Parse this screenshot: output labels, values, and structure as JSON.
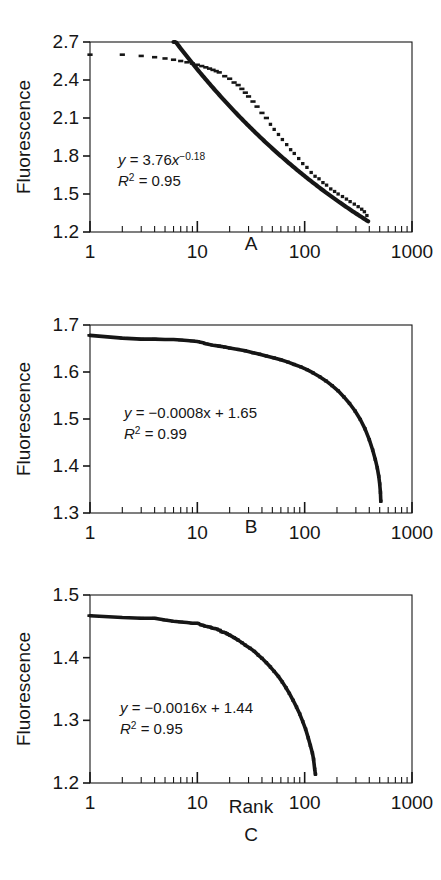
{
  "figure": {
    "y_axis_label": "Fluorescence",
    "x_axis_label": "Rank",
    "ink_color": "#161616"
  },
  "chart_data": [
    {
      "id": "A",
      "type": "scatter",
      "panel_label": "A",
      "title": "",
      "xlabel": "",
      "ylabel": "Fluorescence",
      "xscale": "log",
      "xlim": [
        1,
        1000
      ],
      "xticks": [
        1,
        10,
        100,
        1000
      ],
      "xtick_labels": [
        "1",
        "10",
        "100",
        "1000"
      ],
      "ylim": [
        1.2,
        2.7
      ],
      "yticks": [
        1.2,
        1.5,
        1.8,
        2.1,
        2.4,
        2.7
      ],
      "ytick_labels": [
        "1.2",
        "1.5",
        "1.8",
        "2.1",
        "2.4",
        "2.7"
      ],
      "grid": false,
      "legend": "none",
      "annotations": [
        "y = 3.76x^-0.18",
        "R^2 = 0.95"
      ],
      "equation_text": "y = 3.76x",
      "equation_exponent": "−0.18",
      "r2_text": " = 0.95",
      "fit": {
        "kind": "power",
        "a": 3.76,
        "b": -0.18,
        "r2": 0.95,
        "x_start": 6,
        "x_end": 390
      },
      "data_x": [
        1,
        2,
        3,
        4,
        5,
        6,
        7,
        8,
        9,
        10,
        11,
        12,
        13,
        14,
        15,
        16,
        18,
        20,
        22,
        24,
        26,
        28,
        30,
        33,
        36,
        40,
        44,
        48,
        52,
        57,
        62,
        68,
        74,
        80,
        88,
        96,
        105,
        115,
        125,
        136,
        148,
        160,
        175,
        190,
        205,
        225,
        245,
        265,
        290,
        315,
        340,
        360,
        380
      ],
      "data_y": [
        2.6,
        2.6,
        2.59,
        2.58,
        2.57,
        2.56,
        2.55,
        2.54,
        2.53,
        2.52,
        2.51,
        2.5,
        2.49,
        2.48,
        2.47,
        2.46,
        2.43,
        2.41,
        2.38,
        2.36,
        2.33,
        2.3,
        2.27,
        2.23,
        2.19,
        2.14,
        2.1,
        2.05,
        2.01,
        1.97,
        1.93,
        1.89,
        1.85,
        1.82,
        1.78,
        1.74,
        1.71,
        1.67,
        1.64,
        1.62,
        1.59,
        1.57,
        1.54,
        1.52,
        1.5,
        1.48,
        1.46,
        1.44,
        1.42,
        1.4,
        1.38,
        1.36,
        1.33
      ]
    },
    {
      "id": "B",
      "type": "scatter",
      "panel_label": "B",
      "title": "",
      "xlabel": "",
      "ylabel": "Fluorescence",
      "xscale": "log",
      "xlim": [
        1,
        1000
      ],
      "xticks": [
        1,
        10,
        100,
        1000
      ],
      "xtick_labels": [
        "1",
        "10",
        "100",
        "1000"
      ],
      "ylim": [
        1.3,
        1.7
      ],
      "yticks": [
        1.3,
        1.4,
        1.5,
        1.6,
        1.7
      ],
      "ytick_labels": [
        "1.3",
        "1.4",
        "1.5",
        "1.6",
        "1.7"
      ],
      "grid": false,
      "legend": "none",
      "annotations": [
        "y = −0.0008x + 1.65",
        "R^2 = 0.99"
      ],
      "equation_text": "y = −0.0008x + 1.65",
      "r2_text": " = 0.99",
      "fit": {
        "kind": "curve",
        "r2": 0.99
      },
      "data_x": [
        1,
        2,
        3,
        4,
        5,
        6,
        7,
        8,
        9,
        10,
        11,
        12,
        14,
        16,
        18,
        20,
        24,
        28,
        33,
        38,
        44,
        52,
        60,
        70,
        80,
        92,
        105,
        120,
        138,
        158,
        180,
        205,
        232,
        262,
        295,
        330,
        365,
        400,
        430,
        455,
        475,
        490,
        500,
        508,
        512
      ],
      "data_y": [
        1.678,
        1.672,
        1.67,
        1.67,
        1.669,
        1.669,
        1.668,
        1.667,
        1.666,
        1.665,
        1.663,
        1.66,
        1.657,
        1.655,
        1.653,
        1.651,
        1.648,
        1.645,
        1.641,
        1.638,
        1.634,
        1.63,
        1.626,
        1.621,
        1.616,
        1.611,
        1.605,
        1.598,
        1.59,
        1.581,
        1.571,
        1.56,
        1.547,
        1.533,
        1.517,
        1.499,
        1.479,
        1.456,
        1.434,
        1.414,
        1.396,
        1.378,
        1.362,
        1.344,
        1.325
      ]
    },
    {
      "id": "C",
      "type": "scatter",
      "panel_label": "C",
      "title": "",
      "xlabel": "Rank",
      "ylabel": "Fluorescence",
      "xscale": "log",
      "xlim": [
        1,
        1000
      ],
      "xticks": [
        1,
        10,
        100,
        1000
      ],
      "xtick_labels": [
        "1",
        "10",
        "100",
        "1000"
      ],
      "ylim": [
        1.2,
        1.5
      ],
      "yticks": [
        1.2,
        1.3,
        1.4,
        1.5
      ],
      "ytick_labels": [
        "1.2",
        "1.3",
        "1.4",
        "1.5"
      ],
      "grid": false,
      "legend": "none",
      "annotations": [
        "y = −0.0016x + 1.44",
        "R^2 = 0.95"
      ],
      "equation_text": "y = −0.0016x + 1.44",
      "r2_text": " = 0.95",
      "fit": {
        "kind": "curve",
        "r2": 0.95
      },
      "data_x": [
        1,
        2,
        3,
        4,
        5,
        6,
        7,
        8,
        9,
        10,
        11,
        12,
        13,
        14,
        15,
        16,
        17,
        18,
        19,
        20,
        22,
        24,
        26,
        28,
        31,
        34,
        37,
        40,
        44,
        48,
        52,
        57,
        62,
        67,
        72,
        78,
        84,
        90,
        96,
        102,
        108,
        113,
        118,
        121,
        124,
        126
      ],
      "data_y": [
        1.467,
        1.464,
        1.463,
        1.463,
        1.46,
        1.458,
        1.457,
        1.456,
        1.455,
        1.455,
        1.452,
        1.45,
        1.449,
        1.447,
        1.446,
        1.444,
        1.441,
        1.44,
        1.438,
        1.436,
        1.432,
        1.428,
        1.424,
        1.42,
        1.415,
        1.41,
        1.404,
        1.399,
        1.392,
        1.385,
        1.378,
        1.37,
        1.361,
        1.352,
        1.343,
        1.332,
        1.321,
        1.31,
        1.298,
        1.286,
        1.272,
        1.26,
        1.248,
        1.238,
        1.222,
        1.214
      ]
    }
  ]
}
